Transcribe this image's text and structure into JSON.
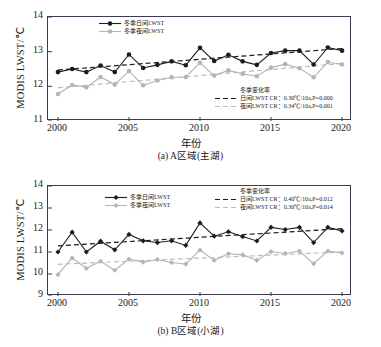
{
  "figure": {
    "colors": {
      "day_line": "#1c1c1c",
      "night_line": "#b5b5b5",
      "day_trend": "#1c1c1c",
      "night_trend": "#bdbdbd",
      "axis": "#3a3a50",
      "background": "#ffffff"
    }
  },
  "chart_data": [
    {
      "type": "line",
      "panel_id": "a",
      "title": "",
      "caption": "(a) A区域(主湖)",
      "xlabel": "年份",
      "ylabel": "MODIS LWST/℃",
      "xlim": [
        1999.3,
        2020.7
      ],
      "ylim": [
        11,
        14
      ],
      "yticks": [
        11,
        12,
        13,
        14
      ],
      "xticks": [
        2000,
        2005,
        2010,
        2015,
        2020
      ],
      "grid": false,
      "legend_position": "top-left",
      "x": [
        2000,
        2001,
        2002,
        2003,
        2004,
        2005,
        2006,
        2007,
        2008,
        2009,
        2010,
        2011,
        2012,
        2013,
        2014,
        2015,
        2016,
        2017,
        2018,
        2019,
        2020
      ],
      "series": [
        {
          "name": "冬季日间LWST",
          "marker": "circle",
          "color": "#1c1c1c",
          "values": [
            12.41,
            12.5,
            12.41,
            12.6,
            12.41,
            12.92,
            12.53,
            12.62,
            12.72,
            12.61,
            13.11,
            12.73,
            12.91,
            12.72,
            12.62,
            12.96,
            13.03,
            13.03,
            12.63,
            13.12,
            13.03
          ]
        },
        {
          "name": "冬季夜间LWST",
          "marker": "circle",
          "color": "#b5b5b5",
          "values": [
            11.78,
            12.04,
            11.97,
            12.27,
            12.05,
            12.44,
            12.03,
            12.17,
            12.26,
            12.27,
            12.68,
            12.31,
            12.46,
            12.36,
            12.29,
            12.54,
            12.64,
            12.52,
            12.26,
            12.7,
            12.63
          ]
        }
      ],
      "trends": [
        {
          "name": "日间LWST CR",
          "label": "日间LWST CR：0.30℃/10a,P=0.000",
          "rate": 0.3,
          "rate_unit": "℃/10a",
          "p_value": 0.0,
          "color": "#1c1c1c",
          "start_value": 12.47,
          "end_value": 13.09
        },
        {
          "name": "夜间LWST CR",
          "label": "夜间LWST CR：0.34℃/10a,P=0.001",
          "rate": 0.34,
          "rate_unit": "℃/10a",
          "p_value": 0.001,
          "color": "#bdbdbd",
          "start_value": 11.96,
          "end_value": 12.66
        }
      ],
      "trend_legend_title": "冬季变化率"
    },
    {
      "type": "line",
      "panel_id": "b",
      "title": "",
      "caption": "(b) B区域(小湖)",
      "xlabel": "年份",
      "ylabel": "MODIS LWST/℃",
      "xlim": [
        1999.3,
        2020.7
      ],
      "ylim": [
        9,
        14
      ],
      "yticks": [
        9,
        10,
        11,
        12,
        13,
        14
      ],
      "xticks": [
        2000,
        2005,
        2010,
        2015,
        2020
      ],
      "grid": false,
      "legend_position": "top-center",
      "x": [
        2000,
        2001,
        2002,
        2003,
        2004,
        2005,
        2006,
        2007,
        2008,
        2009,
        2010,
        2011,
        2012,
        2013,
        2014,
        2015,
        2016,
        2017,
        2018,
        2019,
        2020
      ],
      "series": [
        {
          "name": "冬季日间LWST",
          "marker": "diamond",
          "color": "#1c1c1c",
          "values": [
            11.0,
            11.9,
            11.0,
            11.49,
            11.1,
            11.8,
            11.51,
            11.43,
            11.51,
            11.3,
            12.32,
            11.72,
            11.92,
            11.7,
            11.5,
            12.12,
            12.02,
            12.12,
            11.43,
            12.12,
            11.96
          ]
        },
        {
          "name": "冬季夜间LWST",
          "marker": "diamond",
          "color": "#b5b5b5",
          "values": [
            9.97,
            10.73,
            10.26,
            10.58,
            10.17,
            10.68,
            10.54,
            10.66,
            10.52,
            10.45,
            11.09,
            10.62,
            10.92,
            10.87,
            10.62,
            11.02,
            10.93,
            11.04,
            10.47,
            11.04,
            10.96
          ]
        }
      ],
      "trends": [
        {
          "name": "日间LWST CR",
          "label": "日间LWST CR：0.40℃/10a,P=0.012",
          "rate": 0.4,
          "rate_unit": "℃/10a",
          "p_value": 0.012,
          "color": "#1c1c1c",
          "start_value": 11.28,
          "end_value": 12.06
        },
        {
          "name": "夜间LWST CR",
          "label": "夜间LWST CR：0.30℃/10a,P=0.014",
          "rate": 0.3,
          "rate_unit": "℃/10a",
          "p_value": 0.014,
          "color": "#bdbdbd",
          "start_value": 10.44,
          "end_value": 11.0
        }
      ],
      "trend_legend_title": "冬季变化率"
    }
  ]
}
